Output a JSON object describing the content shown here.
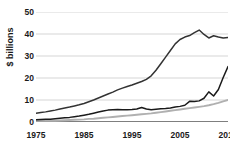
{
  "chart_data": {
    "type": "line",
    "title": "",
    "subtitle": "",
    "xlabel": "",
    "ylabel": "$ billions",
    "xlim": [
      1975,
      2015
    ],
    "ylim": [
      0,
      50
    ],
    "grid": true,
    "grid_axis": "y",
    "legend": "none",
    "yticks": [
      0,
      10,
      20,
      30,
      40,
      50
    ],
    "ytick_labels": [
      "0",
      "10",
      "20",
      "30",
      "40",
      "50"
    ],
    "xticks": [
      1975,
      1985,
      1995,
      2005,
      2015
    ],
    "xtick_labels": [
      "1975",
      "1985",
      "1995",
      "2005",
      "2015"
    ],
    "x": [
      1975,
      1976,
      1977,
      1978,
      1979,
      1980,
      1981,
      1982,
      1983,
      1984,
      1985,
      1986,
      1987,
      1988,
      1989,
      1990,
      1991,
      1992,
      1993,
      1994,
      1995,
      1996,
      1997,
      1998,
      1999,
      2000,
      2001,
      2002,
      2003,
      2004,
      2005,
      2006,
      2007,
      2008,
      2009,
      2010,
      2011,
      2012,
      2013,
      2014,
      2015
    ],
    "series": [
      {
        "name": "series-1",
        "color": "#333333",
        "values": [
          4.0,
          4.3,
          4.6,
          5.0,
          5.4,
          5.9,
          6.4,
          6.8,
          7.3,
          7.8,
          8.4,
          9.2,
          10.0,
          10.9,
          11.8,
          12.7,
          13.6,
          14.6,
          15.4,
          16.1,
          16.8,
          17.6,
          18.4,
          19.4,
          21.0,
          23.5,
          26.5,
          29.5,
          32.5,
          35.5,
          37.5,
          38.6,
          39.3,
          40.6,
          41.8,
          39.8,
          38.2,
          39.2,
          38.6,
          38.2,
          38.4
        ]
      },
      {
        "name": "series-2",
        "color": "#1a1a1a",
        "values": [
          1.0,
          1.1,
          1.2,
          1.3,
          1.5,
          1.7,
          1.9,
          2.1,
          2.4,
          2.7,
          3.1,
          3.5,
          4.0,
          4.5,
          5.0,
          5.4,
          5.6,
          5.7,
          5.6,
          5.6,
          5.7,
          5.9,
          6.6,
          5.9,
          5.6,
          5.8,
          6.0,
          6.1,
          6.4,
          6.8,
          7.1,
          7.6,
          9.4,
          9.3,
          9.6,
          10.8,
          13.7,
          11.8,
          14.8,
          20.2,
          25.2
        ]
      },
      {
        "name": "series-3",
        "color": "#b0b0b0",
        "values": [
          0.5,
          0.5,
          0.5,
          0.6,
          0.6,
          0.7,
          0.8,
          0.9,
          1.0,
          1.1,
          1.2,
          1.4,
          1.5,
          1.7,
          1.9,
          2.1,
          2.3,
          2.5,
          2.7,
          2.9,
          3.1,
          3.3,
          3.5,
          3.7,
          3.9,
          4.2,
          4.5,
          4.8,
          5.1,
          5.4,
          5.7,
          6.0,
          6.3,
          6.6,
          6.9,
          7.2,
          7.6,
          8.1,
          8.7,
          9.4,
          10.0
        ]
      }
    ]
  },
  "style": {
    "grid_color": "#e3e3e3",
    "axis_color": "#555555",
    "text_color": "#1a1a1a",
    "background": "#ffffff"
  }
}
